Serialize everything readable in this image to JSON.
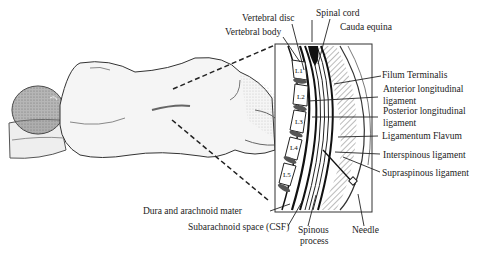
{
  "diagram": {
    "vertebrae": [
      "L1",
      "L2",
      "L3",
      "L4",
      "L5"
    ],
    "labels": {
      "vertebral_disc": "Vertebral disc",
      "vertebral_body": "Vertebral body",
      "spinal_cord": "Spinal cord",
      "cauda_equina": "Cauda equina",
      "filum_terminalis": "Filum Terminalis",
      "anterior_longitudinal_1": "Anterior longitudinal",
      "anterior_longitudinal_2": "ligament",
      "posterior_longitudinal_1": "Posterior longitudinal",
      "posterior_longitudinal_2": "ligament",
      "ligamentum_flavum": "Ligamentum Flavum",
      "interspinous": "Interspinous ligament",
      "supraspinous": "Supraspinous ligament",
      "dura_arachnoid": "Dura and arachnoid mater",
      "subarachnoid": "Subarachnoid space (CSF)",
      "spinous_1": "Spinous",
      "spinous_2": "process",
      "needle": "Needle"
    },
    "colors": {
      "ink": "#1a1a1a",
      "shade": "#8a8a8a",
      "background": "#ffffff"
    }
  }
}
